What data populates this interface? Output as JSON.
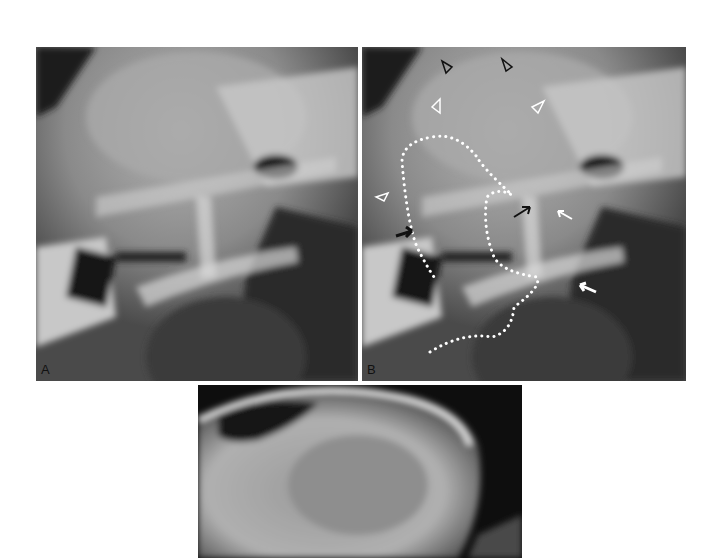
{
  "figure": {
    "panels": [
      {
        "id": "A",
        "label": "A",
        "description": "Lateral radiograph of skull/pharyngeal region"
      },
      {
        "id": "B",
        "label": "B",
        "description": "Same radiograph annotated with dotted outline, arrowheads and arrows"
      },
      {
        "id": "C",
        "label": "",
        "description": "Lateral radiograph of skull, cropped at bottom"
      }
    ],
    "annotations_b": {
      "arrowheads_black": 3,
      "arrowheads_white": 3,
      "arrows_black": 2,
      "arrows_white": 2,
      "dotted_outline": true
    },
    "colors": {
      "background": "#ffffff",
      "label_text": "#111111",
      "dotted_outline": "#ffffff"
    }
  }
}
